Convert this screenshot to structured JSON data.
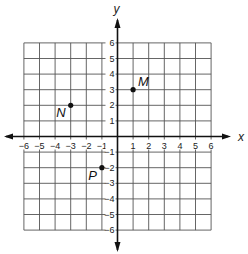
{
  "diagram": {
    "type": "coordinate-plane",
    "x_axis_label": "x",
    "y_axis_label": "y",
    "x_range": [
      -6,
      6
    ],
    "y_range": [
      -6,
      6
    ],
    "x_ticks": [
      "-6",
      "-5",
      "-4",
      "-3",
      "-2",
      "-1",
      "1",
      "2",
      "3",
      "4",
      "5",
      "6"
    ],
    "y_ticks": [
      "6",
      "5",
      "4",
      "3",
      "2",
      "1",
      "-1",
      "-2",
      "-3",
      "-4",
      "-5",
      "-6"
    ],
    "points": [
      {
        "label": "M",
        "x": 1,
        "y": 3
      },
      {
        "label": "N",
        "x": -3,
        "y": 2
      },
      {
        "label": "P",
        "x": -1,
        "y": -2
      }
    ]
  }
}
